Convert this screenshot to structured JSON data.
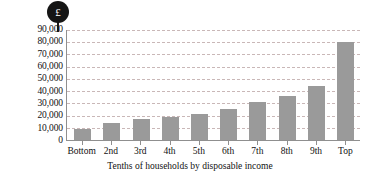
{
  "badge": {
    "symbol": "£",
    "name": "currency-badge"
  },
  "chart_data": {
    "type": "bar",
    "title": "",
    "subtitle": "",
    "categories": [
      "Bottom",
      "2nd",
      "3rd",
      "4th",
      "5th",
      "6th",
      "7th",
      "8th",
      "9th",
      "Top"
    ],
    "values": [
      9000,
      14000,
      17000,
      19000,
      21000,
      25000,
      31000,
      36000,
      44000,
      80000
    ],
    "xlabel": "Tenths of households by disposable income",
    "ylabel": "",
    "ylim": [
      0,
      90000
    ],
    "ytick_step": 10000,
    "ytick_labels": [
      "90,000",
      "80,000",
      "70,000",
      "60,000",
      "50,000",
      "40,000",
      "30,000",
      "20,000",
      "10,000",
      "0"
    ],
    "ytick_values": [
      90000,
      80000,
      70000,
      60000,
      50000,
      40000,
      30000,
      20000,
      10000,
      0
    ],
    "grid": true,
    "legend": "none",
    "bar_color": "#9a9a9a",
    "gridline_color": "#c9b7b7",
    "axis_color": "#8f8f8f",
    "badge_color": "#151515"
  }
}
